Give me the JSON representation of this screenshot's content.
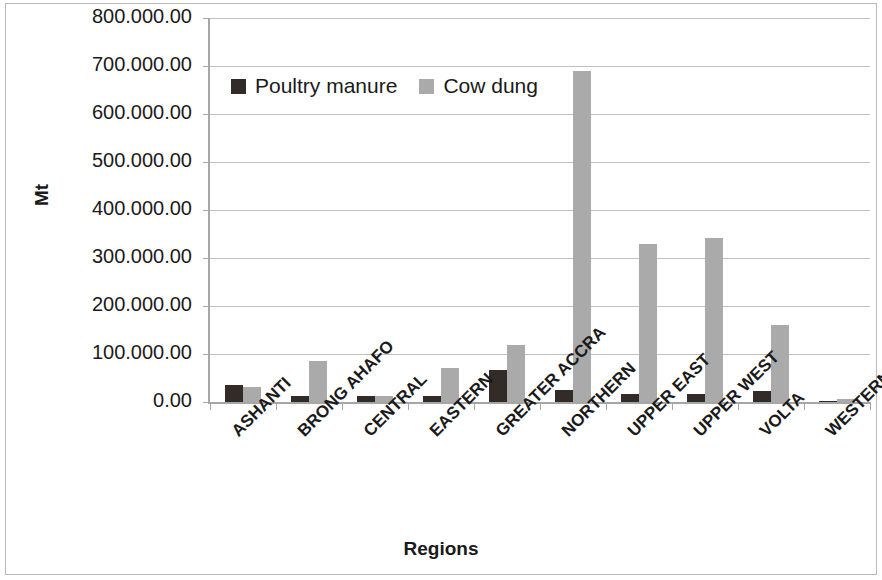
{
  "chart_data": {
    "type": "bar",
    "title": "",
    "xlabel": "Regions",
    "ylabel": "Mt",
    "ylim": [
      0,
      800000
    ],
    "ytick_step": 100000,
    "ytick_labels": [
      "0.00",
      "100.000.00",
      "200.000.00",
      "300.000.00",
      "400.000.00",
      "500.000.00",
      "600.000.00",
      "700.000.00",
      "800.000.00"
    ],
    "ytick_values": [
      0,
      100000,
      200000,
      300000,
      400000,
      500000,
      600000,
      700000,
      800000
    ],
    "grid": true,
    "legend_position": "top-left-inside",
    "categories": [
      "ASHANTI",
      "BRONG AHAFO",
      "CENTRAL",
      "EASTERN",
      "GREATER ACCRA",
      "NORTHERN",
      "UPPER EAST",
      "UPPER WEST",
      "VOLTA",
      "WESTERN"
    ],
    "series": [
      {
        "name": "Poultry manure",
        "color": "#332b27",
        "values": [
          35000,
          13000,
          12000,
          13000,
          67000,
          24000,
          17000,
          17000,
          23000,
          3000
        ]
      },
      {
        "name": "Cow dung",
        "color": "#aaaaaa",
        "values": [
          31000,
          85000,
          13000,
          70000,
          118000,
          690000,
          330000,
          342000,
          161000,
          6000
        ]
      }
    ]
  },
  "legend": {
    "items": [
      {
        "label": "Poultry manure"
      },
      {
        "label": "Cow dung"
      }
    ]
  }
}
